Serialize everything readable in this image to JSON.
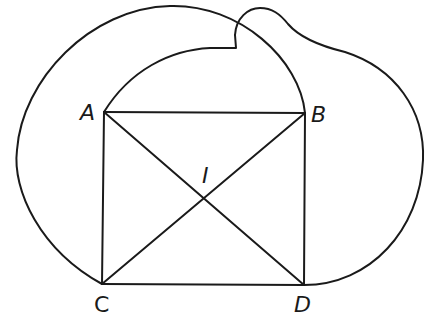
{
  "diagram": {
    "type": "geometric-figure",
    "stroke_color": "#1a1a1a",
    "background_color": "#ffffff",
    "points": {
      "A": {
        "label": "A",
        "x": 104,
        "y": 112
      },
      "B": {
        "label": "B",
        "x": 305,
        "y": 113
      },
      "C": {
        "label": "C",
        "x": 102,
        "y": 284
      },
      "D": {
        "label": "D",
        "x": 304,
        "y": 285
      },
      "I": {
        "label": "I",
        "x": 205,
        "y": 198
      }
    },
    "segments": [
      {
        "from": "A",
        "to": "B"
      },
      {
        "from": "B",
        "to": "D"
      },
      {
        "from": "D",
        "to": "C"
      },
      {
        "from": "C",
        "to": "A"
      },
      {
        "from": "A",
        "to": "D"
      },
      {
        "from": "B",
        "to": "C"
      }
    ],
    "curves": [
      {
        "name": "outer-left-arc",
        "from": "C",
        "to": "B",
        "via": "top-left"
      },
      {
        "name": "inner-arc",
        "from": "A",
        "to": "notch"
      },
      {
        "name": "top-bump-and-right-arc",
        "from": "notch",
        "to": "D",
        "via": "right"
      }
    ]
  }
}
